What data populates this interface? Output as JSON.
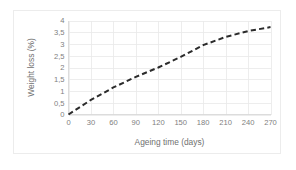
{
  "chart_data": {
    "type": "line",
    "title": "",
    "subtitle": "",
    "xlabel": "Ageing time (days)",
    "ylabel": "Weight loss (%)",
    "xlim": [
      0,
      270
    ],
    "ylim": [
      0,
      4
    ],
    "grid": true,
    "legend": null,
    "legend_position": "none",
    "decimal_separator": ",",
    "line_style": "dashed",
    "line_color": "#2b2b2b",
    "x_ticks": [
      0,
      30,
      60,
      90,
      120,
      150,
      180,
      210,
      240,
      270
    ],
    "x_tick_labels": [
      "0",
      "30",
      "60",
      "90",
      "120",
      "150",
      "180",
      "210",
      "240",
      "270"
    ],
    "y_ticks": [
      0,
      0.5,
      1,
      1.5,
      2,
      2.5,
      3,
      3.5,
      4
    ],
    "y_tick_labels": [
      "0",
      "0,5",
      "1",
      "1,5",
      "2",
      "2,5",
      "3",
      "3,5",
      "4"
    ],
    "series": [
      {
        "name": "Weight loss",
        "x": [
          0,
          30,
          60,
          90,
          120,
          150,
          180,
          210,
          240,
          270
        ],
        "values": [
          0.0,
          0.62,
          1.15,
          1.6,
          2.0,
          2.45,
          2.95,
          3.3,
          3.55,
          3.72
        ]
      }
    ]
  },
  "axes": {
    "x_title": "Ageing time (days)",
    "y_title": "Weight loss (%)"
  }
}
